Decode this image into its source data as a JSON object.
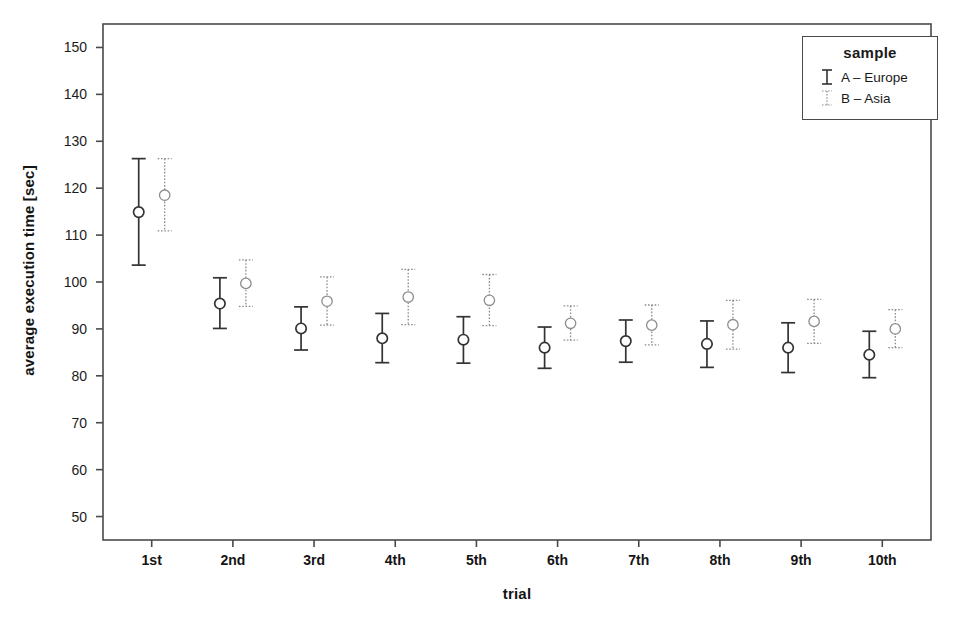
{
  "chart_data": {
    "type": "scatter",
    "title": "",
    "subtitle": "",
    "xlabel": "trial",
    "ylabel": "average execution time [sec]",
    "categories": [
      "1st",
      "2nd",
      "3rd",
      "4th",
      "5th",
      "6th",
      "7th",
      "8th",
      "9th",
      "10th"
    ],
    "ylim": [
      45,
      155
    ],
    "yticks": [
      50,
      60,
      70,
      80,
      90,
      100,
      110,
      120,
      130,
      140,
      150
    ],
    "ytick_labels": [
      "50",
      "60",
      "70",
      "80",
      "90",
      "100",
      "110",
      "120",
      "130",
      "140",
      "150"
    ],
    "xlim": [
      0.4,
      10.6
    ],
    "grid": false,
    "legend_position": "top-right",
    "legend_title": "sample",
    "error_bar_type": "95% CI",
    "series": [
      {
        "name": "A – Europe",
        "short": "A",
        "region": "Europe",
        "line_style": "solid",
        "color": "#333333",
        "marker": "open-circle",
        "offset": -0.16,
        "values": [
          114.9,
          95.4,
          90.1,
          88.0,
          87.7,
          86.0,
          87.4,
          86.8,
          86.0,
          84.5
        ],
        "err_low": [
          103.6,
          90.1,
          85.5,
          82.8,
          82.7,
          81.6,
          82.9,
          81.8,
          80.7,
          79.6
        ],
        "err_high": [
          126.3,
          100.9,
          94.7,
          93.3,
          92.6,
          90.4,
          91.9,
          91.7,
          91.3,
          89.5
        ]
      },
      {
        "name": "B – Asia",
        "short": "B",
        "region": "Asia",
        "line_style": "dotted",
        "color": "#8c8c8c",
        "marker": "open-circle",
        "offset": 0.16,
        "values": [
          118.5,
          99.7,
          95.9,
          96.8,
          96.1,
          91.2,
          90.8,
          90.9,
          91.6,
          90.0
        ],
        "err_low": [
          110.9,
          94.8,
          90.8,
          90.9,
          90.7,
          87.6,
          86.6,
          85.7,
          86.9,
          86.0
        ],
        "err_high": [
          126.3,
          104.7,
          101.1,
          102.7,
          101.6,
          94.9,
          95.1,
          96.1,
          96.3,
          94.1
        ]
      }
    ]
  },
  "legend": {
    "title": "sample",
    "entries": [
      {
        "label": "A – Europe",
        "style": "solid"
      },
      {
        "label": "B – Asia",
        "style": "dotted"
      }
    ]
  },
  "axes": {
    "x_title": "trial",
    "y_title": "average execution time [sec]"
  },
  "colors": {
    "series_a": "#333333",
    "series_b": "#8c8c8c",
    "frame": "#4a4a4a",
    "background": "#ffffff"
  }
}
